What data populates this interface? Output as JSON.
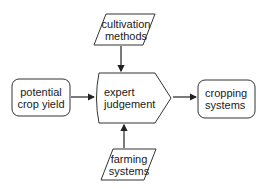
{
  "diagram": {
    "nodes": [
      {
        "id": "cultivation",
        "shape": "parallelogram",
        "lines": [
          "cultivation",
          "methods"
        ]
      },
      {
        "id": "potential",
        "shape": "rounded-rect",
        "lines": [
          "potential",
          "crop yield"
        ]
      },
      {
        "id": "expert",
        "shape": "pentagon-arrow",
        "lines": [
          "expert",
          "judgement"
        ]
      },
      {
        "id": "cropping",
        "shape": "rounded-rect",
        "lines": [
          "cropping",
          "systems"
        ]
      },
      {
        "id": "farming",
        "shape": "parallelogram",
        "lines": [
          "farming",
          "systems"
        ]
      }
    ],
    "edges": [
      {
        "from": "cultivation",
        "to": "expert"
      },
      {
        "from": "potential",
        "to": "expert"
      },
      {
        "from": "farming",
        "to": "expert"
      },
      {
        "from": "expert",
        "to": "cropping"
      }
    ]
  },
  "colors": {
    "stroke": "#333333",
    "text": "#1a1a1a",
    "background": "#ffffff"
  }
}
